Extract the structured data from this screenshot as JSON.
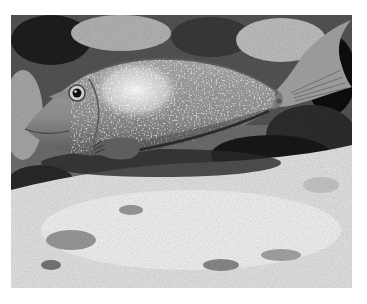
{
  "image": {
    "subject": "fish",
    "description": "Grayscale photograph of a unicornfish swimming left over a coral reef, with pale sandy/coral rubble in the foreground",
    "palette": {
      "background": "#ffffff",
      "reef_dark": "#1e1e1e",
      "reef_mid": "#7a7a7a",
      "sand_light": "#ececec",
      "fish_body": "#8c8c8c",
      "fish_highlight": "#e6e6e6",
      "fish_shadow": "#3a3a3a"
    }
  }
}
